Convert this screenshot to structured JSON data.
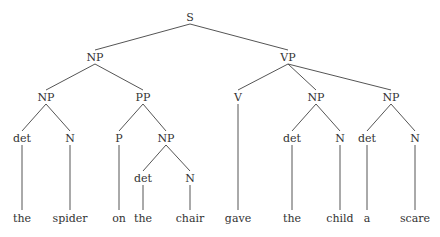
{
  "diagram": {
    "type": "syntax-tree",
    "nodes": {
      "S": {
        "label": "S",
        "x": 190,
        "y": 17
      },
      "NP1": {
        "label": "NP",
        "x": 95,
        "y": 57
      },
      "VP": {
        "label": "VP",
        "x": 288,
        "y": 57
      },
      "NP2": {
        "label": "NP",
        "x": 46,
        "y": 97
      },
      "PP": {
        "label": "PP",
        "x": 143,
        "y": 97
      },
      "V": {
        "label": "V",
        "x": 238,
        "y": 97
      },
      "NP3": {
        "label": "NP",
        "x": 316,
        "y": 97
      },
      "NP4": {
        "label": "NP",
        "x": 391,
        "y": 97
      },
      "det1": {
        "label": "det",
        "x": 22,
        "y": 138
      },
      "N1": {
        "label": "N",
        "x": 70,
        "y": 138
      },
      "P": {
        "label": "P",
        "x": 119,
        "y": 138
      },
      "NP5": {
        "label": "NP",
        "x": 166,
        "y": 138
      },
      "det3": {
        "label": "det",
        "x": 292,
        "y": 138
      },
      "N3": {
        "label": "N",
        "x": 340,
        "y": 138
      },
      "det4": {
        "label": "det",
        "x": 367,
        "y": 138
      },
      "N4": {
        "label": "N",
        "x": 415,
        "y": 138
      },
      "det2": {
        "label": "det",
        "x": 143,
        "y": 178
      },
      "N2": {
        "label": "N",
        "x": 190,
        "y": 178
      },
      "w1": {
        "label": "the",
        "x": 22,
        "y": 218
      },
      "w2": {
        "label": "spider",
        "x": 70,
        "y": 218
      },
      "w3": {
        "label": "on",
        "x": 119,
        "y": 218
      },
      "w4": {
        "label": "the",
        "x": 143,
        "y": 218
      },
      "w5": {
        "label": "chair",
        "x": 190,
        "y": 218
      },
      "w6": {
        "label": "gave",
        "x": 238,
        "y": 218
      },
      "w7": {
        "label": "the",
        "x": 292,
        "y": 218
      },
      "w8": {
        "label": "child",
        "x": 340,
        "y": 218
      },
      "w9": {
        "label": "a",
        "x": 367,
        "y": 218
      },
      "w10": {
        "label": "scare",
        "x": 415,
        "y": 218
      }
    },
    "edges": [
      [
        "S",
        "NP1"
      ],
      [
        "S",
        "VP"
      ],
      [
        "NP1",
        "NP2"
      ],
      [
        "NP1",
        "PP"
      ],
      [
        "VP",
        "V"
      ],
      [
        "VP",
        "NP3"
      ],
      [
        "VP",
        "NP4"
      ],
      [
        "NP2",
        "det1"
      ],
      [
        "NP2",
        "N1"
      ],
      [
        "PP",
        "P"
      ],
      [
        "PP",
        "NP5"
      ],
      [
        "NP5",
        "det2"
      ],
      [
        "NP5",
        "N2"
      ],
      [
        "NP3",
        "det3"
      ],
      [
        "NP3",
        "N3"
      ],
      [
        "NP4",
        "det4"
      ],
      [
        "NP4",
        "N4"
      ],
      [
        "det1",
        "w1"
      ],
      [
        "N1",
        "w2"
      ],
      [
        "P",
        "w3"
      ],
      [
        "det2",
        "w4"
      ],
      [
        "N2",
        "w5"
      ],
      [
        "V",
        "w6"
      ],
      [
        "det3",
        "w7"
      ],
      [
        "N3",
        "w8"
      ],
      [
        "det4",
        "w9"
      ],
      [
        "N4",
        "w10"
      ]
    ]
  }
}
